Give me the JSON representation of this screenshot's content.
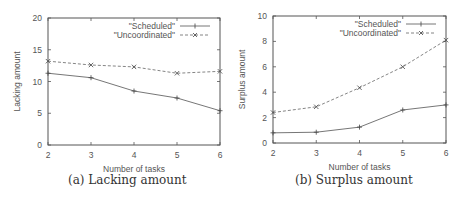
{
  "chart_data": [
    {
      "type": "line",
      "title": "",
      "caption": "(a) Lacking amount",
      "xlabel": "Number of tasks",
      "ylabel": "Lacking amount",
      "x": [
        2,
        3,
        4,
        5,
        6
      ],
      "xticks": [
        "2",
        "3",
        "4",
        "5",
        "6"
      ],
      "yticks": [
        "0",
        "5",
        "10",
        "15",
        "20"
      ],
      "xlim": [
        2,
        6
      ],
      "ylim": [
        0,
        20
      ],
      "grid": false,
      "legend_position": "top-right",
      "series": [
        {
          "name": "\"Scheduled\"",
          "values": [
            11.3,
            10.6,
            8.5,
            7.4,
            5.4
          ],
          "style": "solid",
          "marker": "+"
        },
        {
          "name": "\"Uncoordinated\"",
          "values": [
            13.2,
            12.6,
            12.3,
            11.3,
            11.6
          ],
          "style": "dashed",
          "marker": "x"
        }
      ]
    },
    {
      "type": "line",
      "title": "",
      "caption": "(b) Surplus amount",
      "xlabel": "Number of tasks",
      "ylabel": "Surplus amount",
      "x": [
        2,
        3,
        4,
        5,
        6
      ],
      "xticks": [
        "2",
        "3",
        "4",
        "5",
        "6"
      ],
      "yticks": [
        "0",
        "2",
        "4",
        "6",
        "8",
        "10"
      ],
      "xlim": [
        2,
        6
      ],
      "ylim": [
        0,
        10
      ],
      "grid": false,
      "legend_position": "top-right",
      "series": [
        {
          "name": "\"Scheduled\"",
          "values": [
            0.8,
            0.85,
            1.25,
            2.6,
            3.0
          ],
          "style": "solid",
          "marker": "+"
        },
        {
          "name": "\"Uncoordinated\"",
          "values": [
            2.4,
            2.85,
            4.35,
            6.0,
            8.1
          ],
          "style": "dashed",
          "marker": "x"
        }
      ]
    }
  ],
  "captions": {
    "a": "(a) Lacking amount",
    "b": "(b) Surplus amount"
  }
}
